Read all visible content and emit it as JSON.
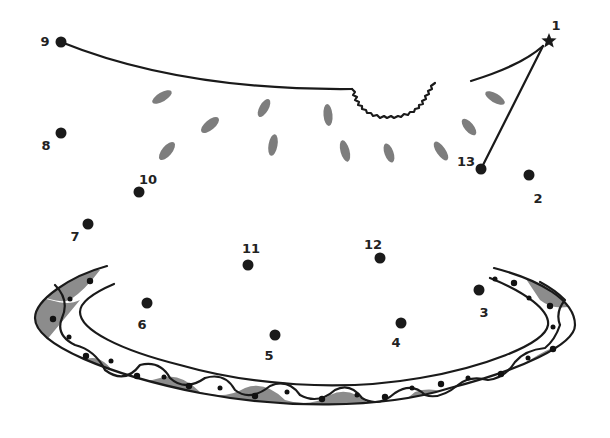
{
  "worksheet": {
    "title": "Connect the dots",
    "start_marker": "star-icon",
    "colors": {
      "line": "#1a1a1a",
      "seed": "#7d7d7d",
      "band_fill": "#8c8c8c",
      "background": "#ffffff"
    },
    "dots": [
      {
        "n": "1",
        "x": 549,
        "y": 41,
        "lx": 556,
        "ly": 26,
        "shape": "star"
      },
      {
        "n": "2",
        "x": 529,
        "y": 175,
        "lx": 538,
        "ly": 199,
        "shape": "dot"
      },
      {
        "n": "3",
        "x": 479,
        "y": 290,
        "lx": 484,
        "ly": 313,
        "shape": "dot"
      },
      {
        "n": "4",
        "x": 401,
        "y": 323,
        "lx": 396,
        "ly": 343,
        "shape": "dot"
      },
      {
        "n": "5",
        "x": 275,
        "y": 335,
        "lx": 269,
        "ly": 356,
        "shape": "dot"
      },
      {
        "n": "6",
        "x": 147,
        "y": 303,
        "lx": 142,
        "ly": 325,
        "shape": "dot"
      },
      {
        "n": "7",
        "x": 88,
        "y": 224,
        "lx": 75,
        "ly": 237,
        "shape": "dot"
      },
      {
        "n": "8",
        "x": 61,
        "y": 133,
        "lx": 46,
        "ly": 146,
        "shape": "dot"
      },
      {
        "n": "9",
        "x": 61,
        "y": 42,
        "lx": 45,
        "ly": 42,
        "shape": "dot"
      },
      {
        "n": "10",
        "x": 139,
        "y": 192,
        "lx": 148,
        "ly": 180,
        "shape": "dot"
      },
      {
        "n": "11",
        "x": 248,
        "y": 265,
        "lx": 251,
        "ly": 249,
        "shape": "dot"
      },
      {
        "n": "12",
        "x": 380,
        "y": 258,
        "lx": 373,
        "ly": 245,
        "shape": "dot"
      },
      {
        "n": "13",
        "x": 481,
        "y": 169,
        "lx": 466,
        "ly": 162,
        "shape": "dot"
      }
    ]
  }
}
